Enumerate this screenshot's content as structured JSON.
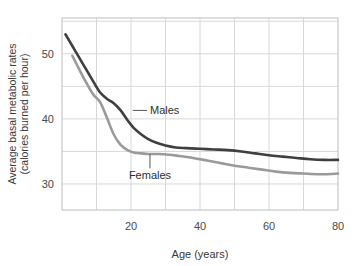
{
  "chart_data": {
    "type": "line",
    "title": "",
    "xlabel": "Age (years)",
    "ylabel": "Average basal metabolic rates (calories burned per hour)",
    "ylabel_line1": "Average basal metabolic rates",
    "ylabel_line2": "(calories burned per hour)",
    "xlim": [
      0,
      80
    ],
    "ylim": [
      26,
      55.5
    ],
    "xticks": [
      20,
      40,
      60,
      80
    ],
    "yticks": [
      30,
      40,
      50
    ],
    "xtick_labels": [
      "20",
      "40",
      "60",
      "80"
    ],
    "ytick_labels": [
      "30",
      "40",
      "50"
    ],
    "x_minor_step": 10,
    "y_minor_step": 5,
    "grid": true,
    "legend_position": "inline-annotations",
    "colors": {
      "males": "#3f3f3f",
      "females": "#9a9a9a",
      "grid": "#d8d8d8",
      "frame": "#c9c9c9",
      "text": "#3a3a3a"
    },
    "annotations": [
      {
        "label": "Males",
        "x": 20.5,
        "y": 41.3,
        "text_x": 25.5,
        "text_y": 41.3
      },
      {
        "label": "Females",
        "x": 25.5,
        "y": 34.6,
        "text_x": 25.5,
        "text_y": 30.7
      }
    ],
    "series": [
      {
        "name": "Males",
        "color": "#3f3f3f",
        "x": [
          1,
          3,
          5,
          7,
          9,
          11,
          13,
          15,
          17,
          19,
          21,
          23,
          25,
          27,
          30,
          33,
          36,
          40,
          44,
          48,
          52,
          56,
          60,
          64,
          68,
          72,
          76,
          80
        ],
        "values": [
          53.0,
          51.2,
          49.4,
          47.6,
          45.8,
          44.1,
          43.1,
          42.4,
          41.3,
          39.8,
          38.5,
          37.6,
          36.9,
          36.4,
          35.9,
          35.6,
          35.5,
          35.4,
          35.3,
          35.2,
          35.0,
          34.7,
          34.4,
          34.2,
          34.0,
          33.8,
          33.7,
          33.7
        ]
      },
      {
        "name": "Females",
        "color": "#9a9a9a",
        "x": [
          3,
          5,
          7,
          9,
          11,
          13,
          15,
          17,
          19,
          21,
          23,
          25,
          28,
          31,
          34,
          38,
          42,
          46,
          50,
          54,
          58,
          62,
          66,
          70,
          74,
          77,
          80
        ],
        "values": [
          49.7,
          47.6,
          45.6,
          43.8,
          42.6,
          40.2,
          37.6,
          36.0,
          35.2,
          34.8,
          34.7,
          34.6,
          34.6,
          34.5,
          34.3,
          34.0,
          33.6,
          33.2,
          32.8,
          32.5,
          32.2,
          31.9,
          31.7,
          31.6,
          31.5,
          31.5,
          31.6
        ]
      }
    ]
  }
}
